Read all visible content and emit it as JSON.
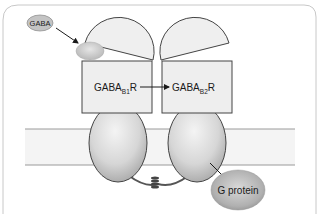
{
  "diagram": {
    "ligand": {
      "label": "GABA"
    },
    "subunit_b1": {
      "base": "GABA",
      "subscript": "B1",
      "suffix": "R"
    },
    "subunit_b2": {
      "base": "GABA",
      "subscript": "B2",
      "suffix": "R"
    },
    "effector": {
      "label": "G protein"
    },
    "arrows": [
      {
        "from": "GABA",
        "to": "GABAB1R extracellular binding site"
      },
      {
        "from": "GABAB1R",
        "to": "GABAB2R"
      },
      {
        "from": "GABAB2R transmembrane domain",
        "to": "G protein"
      }
    ],
    "elements": [
      "cell-membrane",
      "venus-flytrap-domain-b1",
      "venus-flytrap-domain-b2",
      "coiled-coil-linker"
    ]
  },
  "colors": {
    "frame": "#bdbdbd",
    "domain_fill": "#eeeeee",
    "stroke": "#333333",
    "membrane_fill": "#f3f3f3",
    "oval_light": "#f2f2f2",
    "oval_dark": "#a9a9a9",
    "gprotein_dark": "#8e8e8e"
  }
}
